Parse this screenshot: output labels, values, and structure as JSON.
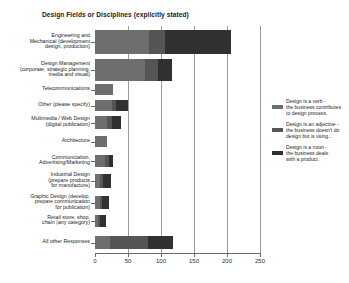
{
  "chart_data": {
    "type": "bar",
    "orientation": "horizontal",
    "stacked": true,
    "title": "Design Fields or Disciplines (explicitly stated)",
    "xlabel": "",
    "ylabel": "",
    "xlim": [
      0,
      250
    ],
    "xticks": [
      0,
      50,
      100,
      150,
      200,
      250
    ],
    "grid": true,
    "legend_position": "right",
    "series": [
      {
        "name": "Design is a verb - the business contributes to design process.",
        "color": "#6e6e6e",
        "values": [
          82,
          75,
          28,
          26,
          18,
          18,
          15,
          8,
          8,
          5,
          22
        ]
      },
      {
        "name": "Design is an adjective - the business doesn't do design but is using...",
        "color": "#555555",
        "values": [
          24,
          20,
          0,
          6,
          8,
          0,
          6,
          4,
          3,
          3,
          58
        ]
      },
      {
        "name": "Design is a noun - the business deals with a product.",
        "color": "#303030",
        "values": [
          100,
          22,
          0,
          18,
          13,
          0,
          6,
          12,
          10,
          9,
          38
        ]
      }
    ],
    "categories": [
      "Engineering and Mechanical (development design, production)",
      "Design Management (corporate, strategic planning, media and visual)",
      "Telecommunications",
      "Other (please specify)",
      "Multimedia / Web Design (digital publication)",
      "Architecture",
      "Communication, Advertising/Marketing",
      "Industrial Design (prepare products for manufacture)",
      "Graphic Design (develop, prepare communication for publication)",
      "Retail store, shop, chain (any category)",
      "All other Responses"
    ],
    "category_lines": [
      [
        "Engineering and",
        "Mechanical (development",
        "design, production)"
      ],
      [
        "Design Management",
        "(corporate, strategic planning,",
        "media and visual)"
      ],
      [
        "Telecommunications"
      ],
      [
        "Other (please specify)"
      ],
      [
        "Multimedia / Web Design",
        "(digital publication)"
      ],
      [
        "Architecture"
      ],
      [
        "Communication,",
        "Advertising/Marketing"
      ],
      [
        "Industrial Design",
        "(prepare products",
        "for manufacture)"
      ],
      [
        "Graphic Design (develop,",
        "prepare communication",
        "for publication)"
      ],
      [
        "Retail store, shop,",
        "chain (any category)"
      ],
      [
        "All other Responses"
      ]
    ]
  },
  "legend": [
    {
      "label": "Design is a verb - the business contributes to design process.",
      "color": "#6e6e6e"
    },
    {
      "label": "Design is an adjective - the business doesn't do design but is using...",
      "color": "#555555"
    },
    {
      "label": "Design is a noun - the business deals with a product.",
      "color": "#303030"
    }
  ],
  "legend_lines": [
    [
      "Design is a verb -",
      "the business contributes",
      "to design process."
    ],
    [
      "Design is an adjective -",
      "the business doesn't do",
      "design but is using..."
    ],
    [
      "Design is a noun -",
      "the business deals",
      "with a product."
    ]
  ]
}
